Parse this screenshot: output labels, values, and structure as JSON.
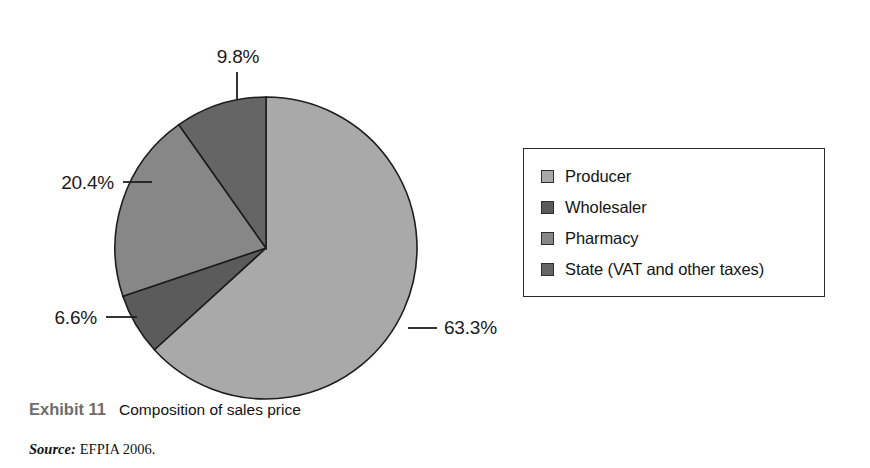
{
  "chart_data": {
    "type": "pie",
    "title": "Composition of sales price",
    "categories": [
      "Producer",
      "Wholesaler",
      "Pharmacy",
      "State (VAT and other taxes)"
    ],
    "values": [
      63.3,
      6.6,
      20.4,
      9.8
    ],
    "unit": "%",
    "data_labels": [
      "63.3%",
      "6.6%",
      "20.4%",
      "9.8%"
    ],
    "colors": [
      "#a9a9a9",
      "#5b5b5b",
      "#878787",
      "#656565"
    ],
    "start_angle_deg": 0,
    "direction": "clockwise",
    "legend_position": "right",
    "grid": false,
    "xlabel": "",
    "ylabel": ""
  },
  "labels": [
    {
      "name": "producer",
      "text": "63.3%",
      "anchor": "right",
      "x": 444,
      "y": 334,
      "line_x1": 408,
      "line_y1": 328,
      "line_x2": 437,
      "line_y2": 328
    },
    {
      "name": "wholesaler",
      "text": "6.6%",
      "anchor": "left",
      "x": 97,
      "y": 324,
      "line_x1": 106,
      "line_y1": 317,
      "line_x2": 137,
      "line_y2": 317
    },
    {
      "name": "pharmacy",
      "text": "20.4%",
      "anchor": "left",
      "x": 114,
      "y": 189,
      "line_x1": 123,
      "line_y1": 182,
      "line_x2": 152,
      "line_y2": 182
    },
    {
      "name": "state",
      "text": "9.8%",
      "anchor": "center",
      "x": 238,
      "y": 63,
      "line_x1": 237,
      "line_y1": 72,
      "line_x2": 237,
      "line_y2": 100
    }
  ],
  "legend": {
    "items": [
      {
        "label": "Producer",
        "color": "#a9a9a9"
      },
      {
        "label": "Wholesaler",
        "color": "#5b5b5b"
      },
      {
        "label": "Pharmacy",
        "color": "#878787"
      },
      {
        "label": "State (VAT and other taxes)",
        "color": "#656565"
      }
    ]
  },
  "caption": {
    "exhibit": "Exhibit 11",
    "title": "Composition of sales price"
  },
  "source": {
    "label": "Source:",
    "text": "EFPIA 2006."
  },
  "geometry": {
    "cx": 266,
    "cy": 248,
    "r": 151
  }
}
